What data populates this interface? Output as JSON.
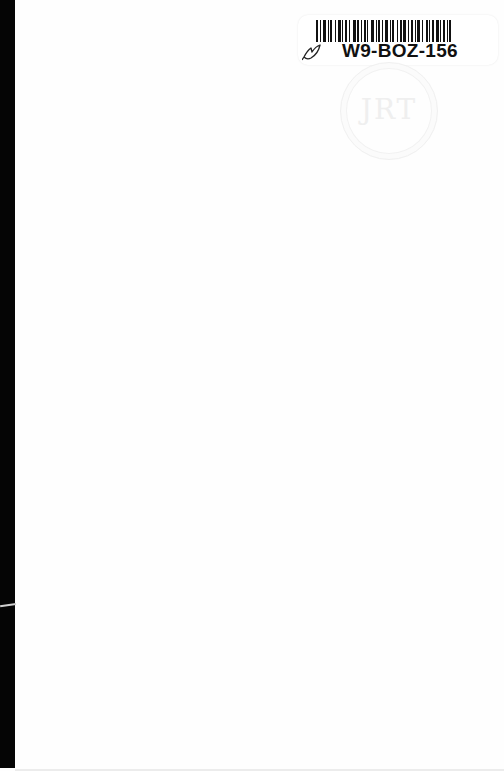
{
  "document": {
    "type": "scanned book page (blank endpaper)",
    "background_color": "#fefefe",
    "spine_color": "#050505"
  },
  "sticker": {
    "barcode_label": "W9-BOZ-156",
    "icon": "leaf-icon"
  },
  "stamp": {
    "text": "JRT",
    "shape": "circle"
  }
}
